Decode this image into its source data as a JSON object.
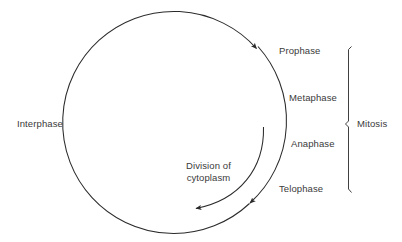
{
  "diagram": {
    "type": "cycle",
    "stroke_color": "#2b2b2b",
    "text_color": "#3a3a3a",
    "background_color": "#ffffff",
    "labels": {
      "interphase": "Interphase",
      "prophase": "Prophase",
      "metaphase": "Metaphase",
      "anaphase": "Anaphase",
      "telophase": "Telophase",
      "mitosis": "Mitosis",
      "division_of_cytoplasm": "Division of\ncytoplasm"
    },
    "grouping": {
      "bracket_label": "Mitosis",
      "bracket_members": [
        "Prophase",
        "Metaphase",
        "Anaphase",
        "Telophase"
      ]
    },
    "arrows": {
      "main_cycle_direction": "clockwise",
      "main_cycle_arrowheads": 2,
      "inner_arrow_label": "Division of cytoplasm",
      "inner_arrow_direction": "clockwise"
    }
  }
}
